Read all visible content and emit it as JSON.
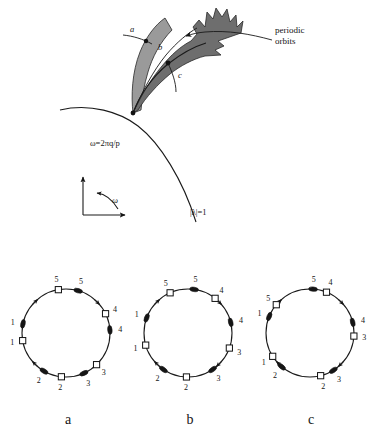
{
  "figure": {
    "title_visible": false,
    "background_color": "#ffffff",
    "ink_color": "#1a1a1a"
  },
  "top_panel": {
    "annotations": {
      "periodic_orbits_line1": "periodic",
      "periodic_orbits_line2": "orbits",
      "resonance_label": "ω=2πq/p",
      "unit_circle_label": "|λ|=1",
      "omega_axis_label": "ω"
    },
    "section_lines": [
      {
        "id": "a",
        "label": "a"
      },
      {
        "id": "b",
        "label": "b"
      },
      {
        "id": "c",
        "label": "c"
      }
    ],
    "tongue": {
      "fill_light": "#9a9a9a",
      "fill_dark": "#6e6e6e",
      "description_visible": false
    }
  },
  "circles": [
    {
      "panel_label": "a",
      "markers": [
        {
          "kind": "square",
          "label": "1",
          "angle_deg": 190,
          "label_side": "outer"
        },
        {
          "kind": "dot",
          "label": "1",
          "angle_deg": 168,
          "label_side": "outer"
        },
        {
          "kind": "square",
          "label": "2",
          "angle_deg": 264,
          "label_side": "outer"
        },
        {
          "kind": "dot",
          "label": "2",
          "angle_deg": 240,
          "label_side": "outer"
        },
        {
          "kind": "square",
          "label": "3",
          "angle_deg": 314,
          "label_side": "outer"
        },
        {
          "kind": "dot",
          "label": "3",
          "angle_deg": 294,
          "label_side": "outer"
        },
        {
          "kind": "square",
          "label": "4",
          "angle_deg": 26,
          "label_side": "outer"
        },
        {
          "kind": "dot",
          "label": "4",
          "angle_deg": 4,
          "label_side": "outer"
        },
        {
          "kind": "square",
          "label": "5",
          "angle_deg": 100,
          "label_side": "outer"
        },
        {
          "kind": "dot",
          "label": "5",
          "angle_deg": 74,
          "label_side": "outer"
        }
      ]
    },
    {
      "panel_label": "b",
      "markers": [
        {
          "kind": "square",
          "label": "1",
          "angle_deg": 196,
          "label_side": "outer"
        },
        {
          "kind": "dot",
          "label": "1",
          "angle_deg": 160,
          "label_side": "outer"
        },
        {
          "kind": "square",
          "label": "2",
          "angle_deg": 268,
          "label_side": "outer"
        },
        {
          "kind": "dot",
          "label": "2",
          "angle_deg": 236,
          "label_side": "outer"
        },
        {
          "kind": "square",
          "label": "3",
          "angle_deg": 340,
          "label_side": "outer"
        },
        {
          "kind": "dot",
          "label": "3",
          "angle_deg": 304,
          "label_side": "outer"
        },
        {
          "kind": "square",
          "label": "4",
          "angle_deg": 52,
          "label_side": "outer"
        },
        {
          "kind": "dot",
          "label": "4",
          "angle_deg": 14,
          "label_side": "outer"
        },
        {
          "kind": "square",
          "label": "5",
          "angle_deg": 114,
          "label_side": "outer"
        },
        {
          "kind": "dot",
          "label": "5",
          "angle_deg": 82,
          "label_side": "outer"
        }
      ]
    },
    {
      "panel_label": "c",
      "markers": [
        {
          "kind": "square",
          "label": "1",
          "angle_deg": 212,
          "label_side": "outer"
        },
        {
          "kind": "dot",
          "label": "1",
          "angle_deg": 158,
          "label_side": "outer"
        },
        {
          "kind": "square",
          "label": "2",
          "angle_deg": 284,
          "label_side": "outer"
        },
        {
          "kind": "dot",
          "label": "2",
          "angle_deg": 230,
          "label_side": "outer"
        },
        {
          "kind": "square",
          "label": "3",
          "angle_deg": 356,
          "label_side": "outer"
        },
        {
          "kind": "dot",
          "label": "3",
          "angle_deg": 302,
          "label_side": "outer"
        },
        {
          "kind": "square",
          "label": "4",
          "angle_deg": 68,
          "label_side": "outer"
        },
        {
          "kind": "dot",
          "label": "4",
          "angle_deg": 14,
          "label_side": "outer"
        },
        {
          "kind": "square",
          "label": "5",
          "angle_deg": 140,
          "label_side": "outer"
        },
        {
          "kind": "dot",
          "label": "5",
          "angle_deg": 86,
          "label_side": "outer"
        }
      ]
    }
  ],
  "panel_labels": [
    {
      "text": "a",
      "x": 68,
      "y": 424
    },
    {
      "text": "b",
      "x": 190,
      "y": 424
    },
    {
      "text": "c",
      "x": 311,
      "y": 424
    }
  ],
  "chart_data": {
    "type": "diagram",
    "title": "",
    "description_visible": false
  }
}
